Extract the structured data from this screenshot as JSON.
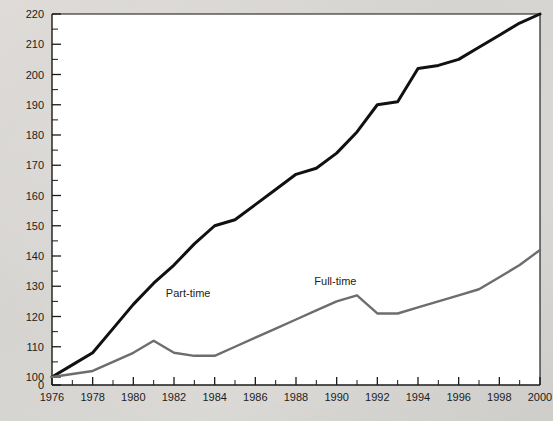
{
  "figure": {
    "background_color": "#d9d9d7",
    "plot_background_color": "#ffffff"
  },
  "chart_data": {
    "type": "line",
    "title": "",
    "subtitle": "",
    "xlabel": "",
    "ylabel": "",
    "x": [
      1976,
      1977,
      1978,
      1979,
      1980,
      1981,
      1982,
      1983,
      1984,
      1985,
      1986,
      1987,
      1988,
      1989,
      1990,
      1991,
      1992,
      1993,
      1994,
      1995,
      1996,
      1997,
      1998,
      1999,
      2000
    ],
    "xlim": [
      1976,
      2000
    ],
    "ylim": [
      100,
      220
    ],
    "y_axis_break_label": "0",
    "y_ticks_major": [
      100,
      110,
      120,
      130,
      140,
      150,
      160,
      170,
      180,
      190,
      200,
      210,
      220
    ],
    "y_ticks_minor": [
      105,
      115,
      125,
      135,
      145,
      155,
      165,
      175,
      185,
      195,
      205,
      215
    ],
    "x_ticks_major": [
      1976,
      1978,
      1980,
      1982,
      1984,
      1986,
      1988,
      1990,
      1992,
      1994,
      1996,
      1998,
      2000
    ],
    "x_ticks_minor": [
      1977,
      1979,
      1981,
      1983,
      1985,
      1987,
      1989,
      1991,
      1993,
      1995,
      1997,
      1999
    ],
    "x_tick_labels": [
      "1976",
      "1978",
      "1980",
      "1982",
      "1984",
      "1986",
      "1988",
      "1990",
      "1992",
      "1994",
      "1996",
      "1998",
      "2000"
    ],
    "y_tick_labels": [
      "0",
      "100",
      "110",
      "120",
      "130",
      "140",
      "150",
      "160",
      "170",
      "180",
      "190",
      "200",
      "210",
      "220"
    ],
    "grid": false,
    "legend_position": "inline-annotation",
    "series": [
      {
        "name": "Part-time",
        "color": "#111111",
        "label_x": 1981.6,
        "label_y": 126.5,
        "values": [
          100,
          104,
          108,
          116,
          124,
          131,
          137,
          144,
          150,
          152,
          157,
          162,
          167,
          169,
          174,
          181,
          190,
          191,
          202,
          203,
          205,
          209,
          213,
          217,
          220
        ]
      },
      {
        "name": "Full-time",
        "color": "#6d6d6d",
        "label_x": 1988.9,
        "label_y": 130.5,
        "values": [
          100,
          101,
          102,
          105,
          108,
          112,
          108,
          107,
          107,
          110,
          113,
          116,
          119,
          122,
          125,
          127,
          121,
          121,
          123,
          125,
          127,
          129,
          133,
          137,
          142
        ]
      }
    ],
    "annotations": [
      {
        "text": "Part-time",
        "x": 1981.6,
        "y": 126.5
      },
      {
        "text": "Full-time",
        "x": 1988.9,
        "y": 130.5
      }
    ]
  }
}
